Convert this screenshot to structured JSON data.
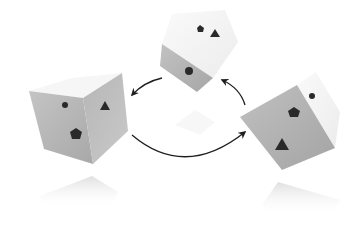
{
  "diagram": {
    "type": "cube-rotation-cycle",
    "background": "#ffffff",
    "colors": {
      "face_gray": "#b9b9b9",
      "face_gray_dark": "#a9a9a9",
      "face_white": "#f4f4f4",
      "symbol": "#2a2a2a",
      "arrow": "#1e1e1e"
    },
    "cubes": [
      {
        "id": "left-cube",
        "faces": [
          {
            "name": "left-face",
            "symbols": [
              "dot",
              "pentagon"
            ]
          },
          {
            "name": "right-face",
            "symbols": [
              "triangle"
            ]
          }
        ]
      },
      {
        "id": "top-cube",
        "faces": [
          {
            "name": "top-face",
            "symbols": [
              "pentagon",
              "triangle"
            ]
          },
          {
            "name": "front-face",
            "symbols": [
              "dot"
            ]
          }
        ]
      },
      {
        "id": "right-cube",
        "faces": [
          {
            "name": "front-face",
            "symbols": [
              "pentagon",
              "triangle"
            ]
          },
          {
            "name": "side-face",
            "symbols": [
              "dot"
            ]
          }
        ]
      }
    ],
    "arrows": [
      {
        "id": "top-to-left",
        "from": "top-cube",
        "to": "left-cube"
      },
      {
        "id": "left-to-right",
        "from": "left-cube",
        "to": "right-cube"
      },
      {
        "id": "right-to-top",
        "from": "right-cube",
        "to": "top-cube"
      }
    ]
  }
}
